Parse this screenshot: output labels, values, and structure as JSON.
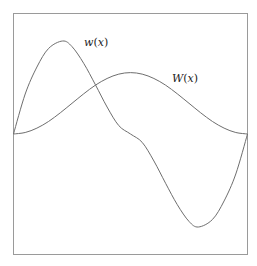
{
  "chart_data": {
    "type": "line",
    "title": "",
    "xlabel": "",
    "ylabel": "",
    "xlim": [
      0,
      1
    ],
    "ylim": [
      -1.3,
      1.3
    ],
    "grid": false,
    "axes_visible": false,
    "frame": true,
    "legend": "inline labels near curves",
    "series": [
      {
        "name": "w(x)",
        "label_text": "w(x)",
        "color": "#6e6e6e",
        "x": [
          0.0,
          0.05,
          0.1,
          0.15,
          0.21,
          0.25,
          0.3,
          0.35,
          0.4,
          0.45,
          0.5,
          0.55,
          0.6,
          0.65,
          0.7,
          0.75,
          0.79,
          0.85,
          0.9,
          0.95,
          1.0
        ],
        "y": [
          0.0,
          0.43,
          0.72,
          0.92,
          1.0,
          0.94,
          0.76,
          0.53,
          0.29,
          0.09,
          0.0,
          -0.09,
          -0.29,
          -0.53,
          -0.76,
          -0.94,
          -1.0,
          -0.92,
          -0.72,
          -0.43,
          0.0
        ]
      },
      {
        "name": "W(x)",
        "label_text": "W(x)",
        "color": "#6e6e6e",
        "x": [
          0.0,
          0.05,
          0.1,
          0.15,
          0.2,
          0.25,
          0.3,
          0.35,
          0.4,
          0.45,
          0.5,
          0.55,
          0.6,
          0.65,
          0.7,
          0.75,
          0.8,
          0.85,
          0.9,
          0.95,
          1.0
        ],
        "y": [
          0.0,
          0.016,
          0.063,
          0.135,
          0.228,
          0.33,
          0.432,
          0.525,
          0.597,
          0.644,
          0.66,
          0.644,
          0.597,
          0.525,
          0.432,
          0.33,
          0.228,
          0.135,
          0.063,
          0.016,
          0.0
        ]
      }
    ],
    "annotations": [
      {
        "text": "w(x)",
        "near": "peak of w(x)",
        "x": 0.31,
        "y": 1.0
      },
      {
        "text": "W(x)",
        "near": "right of W(x) peak",
        "x": 0.69,
        "y": 0.62
      }
    ]
  },
  "labels": {
    "w": {
      "name": "w",
      "open": "(",
      "var": "x",
      "close": ")"
    },
    "W": {
      "name": "W",
      "open": "(",
      "var": "x",
      "close": ")"
    }
  }
}
